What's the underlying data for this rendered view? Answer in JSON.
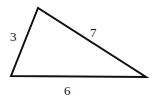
{
  "diagram": {
    "type": "triangle",
    "stroke_color": "#111111",
    "background": "#ffffff",
    "vertices": {
      "top": [
        38,
        8
      ],
      "bottom_left": [
        11,
        76
      ],
      "bottom_right": [
        146,
        77
      ]
    },
    "sides": [
      {
        "id": "left",
        "label": "3"
      },
      {
        "id": "hypotenuse",
        "label": "7"
      },
      {
        "id": "base",
        "label": "6"
      }
    ]
  }
}
